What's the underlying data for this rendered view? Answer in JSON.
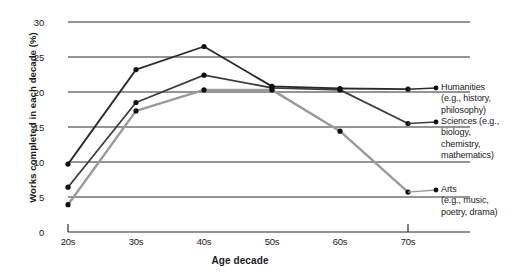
{
  "chart_data": {
    "type": "line",
    "title": "",
    "xlabel": "Age decade",
    "ylabel": "Works completed in each decade (%)",
    "categories": [
      "20s",
      "30s",
      "40s",
      "50s",
      "60s",
      "70s"
    ],
    "xticklabels": [
      "20s",
      "30s",
      "40s",
      "50s",
      "60s",
      "70s"
    ],
    "yticklabels": [
      "0",
      "5",
      "10",
      "15",
      "20",
      "25",
      "30"
    ],
    "yticks": [
      0,
      5,
      10,
      15,
      20,
      25,
      30
    ],
    "ylim": [
      0,
      30
    ],
    "grid": "horizontal",
    "legend_position": "right",
    "series": [
      {
        "name": "Humanities",
        "legend_title": "Humanities",
        "legend_sub": "(e.g., history, philosophy)",
        "color": "#2b2b2b",
        "values": [
          9.7,
          23.2,
          26.5,
          20.8,
          20.5,
          20.4
        ]
      },
      {
        "name": "Sciences",
        "legend_title": "Sciences (e.g.,",
        "legend_sub": "biology, chemistry, mathematics)",
        "color": "#3d3d3d",
        "values": [
          6.4,
          18.5,
          22.4,
          20.6,
          20.3,
          15.5
        ]
      },
      {
        "name": "Arts",
        "legend_title": "Arts",
        "legend_sub": "(e.g., music, poetry, drama)",
        "color": "#9a9a9a",
        "values": [
          3.9,
          17.3,
          20.3,
          20.3,
          14.4,
          5.7
        ]
      }
    ]
  },
  "legend": {
    "humanities": {
      "line1": "Humanities",
      "line2": "(e.g., history,",
      "line3": "philosophy)"
    },
    "sciences": {
      "line1": "Sciences (e.g.,",
      "line2": "biology,",
      "line3": "chemistry,",
      "line4": "mathematics)"
    },
    "arts": {
      "line1": "Arts",
      "line2": "(e.g., music,",
      "line3": "poetry, drama)"
    }
  },
  "axes": {
    "x_title": "Age decade",
    "y_title": "Works completed in each decade (%)"
  },
  "colors": {
    "grid": "#2b2b2b",
    "axis": "#2b2b2b",
    "humanities": "#2b2b2b",
    "sciences": "#3d3d3d",
    "arts": "#9a9a9a"
  }
}
